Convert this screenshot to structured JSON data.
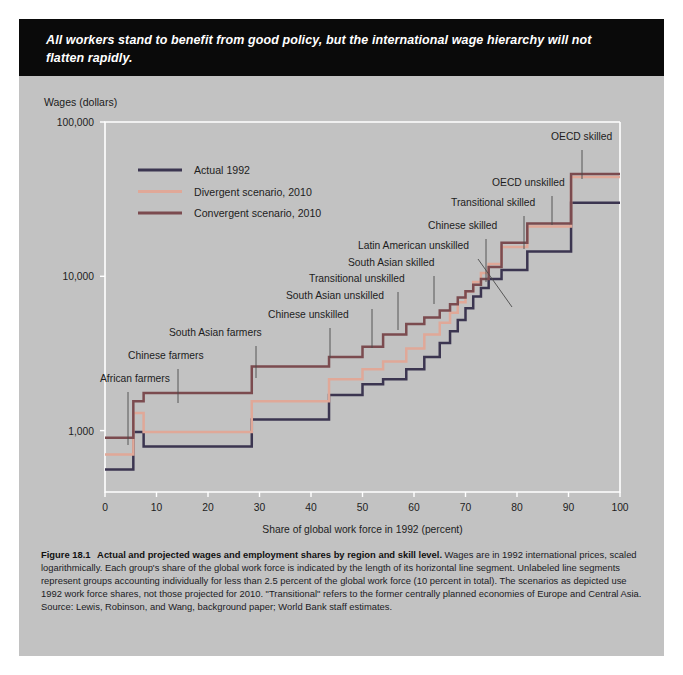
{
  "banner": {
    "text": "All workers stand to benefit from good policy, but the international wage hierarchy will not flatten rapidly."
  },
  "figure": {
    "number": "Figure 18.1",
    "title": "Actual and projected wages and employment shares by region and skill level.",
    "caption": " Wages are in 1992 international prices, scaled logarithmically.  Each group's share of the global work force is indicated by the length of its horizontal line segment. Unlabeled line segments represent groups accounting individually for less than 2.5 percent of the global work force (10 percent in total). The scenarios as depicted use 1992 work force shares, not those projected for 2010. \"Transitional\" refers to the former centrally planned economies of Europe and Central Asia. Source: Lewis, Robinson, and Wang, background paper; World Bank staff estimates."
  },
  "colors": {
    "page": "#c2c2c2",
    "banner": "#0a0a0a",
    "actual": "#3b3550",
    "divergent": "#e0a898",
    "convergent": "#7b4b4f",
    "axis": "#ffffff",
    "text": "#1d1d1d"
  },
  "chart_data": {
    "type": "line",
    "title": "Actual and projected wages and employment shares by region and skill level",
    "xlabel": "Share of global work force in 1992 (percent)",
    "ylabel": "Wages (dollars)",
    "xlim": [
      0,
      100
    ],
    "ylim": [
      400,
      100000
    ],
    "yscale": "log",
    "grid": false,
    "legend_position": "upper-left-inside",
    "xticks": [
      0,
      10,
      20,
      30,
      40,
      50,
      60,
      70,
      80,
      90,
      100
    ],
    "xticklabels": [
      "0",
      "10",
      "20",
      "30",
      "40",
      "50",
      "60",
      "70",
      "80",
      "90",
      "100"
    ],
    "yticks": [
      1000,
      10000,
      100000
    ],
    "yticklabels": [
      "1,000",
      "10,000",
      "100,000"
    ],
    "series": [
      {
        "name": "Actual 1992",
        "color": "#3b3550",
        "steps": [
          {
            "x0": 0,
            "x1": 5.5,
            "y": 560
          },
          {
            "x0": 5.5,
            "x1": 7.5,
            "y": 980
          },
          {
            "x0": 7.5,
            "x1": 28.5,
            "y": 790
          },
          {
            "x0": 28.5,
            "x1": 43.5,
            "y": 1180
          },
          {
            "x0": 43.5,
            "x1": 50.0,
            "y": 1700
          },
          {
            "x0": 50.0,
            "x1": 54.0,
            "y": 2000
          },
          {
            "x0": 54.0,
            "x1": 58.5,
            "y": 2150
          },
          {
            "x0": 58.5,
            "x1": 62.0,
            "y": 2500
          },
          {
            "x0": 62.0,
            "x1": 65.0,
            "y": 3000
          },
          {
            "x0": 65.0,
            "x1": 67.0,
            "y": 3700
          },
          {
            "x0": 67.0,
            "x1": 68.5,
            "y": 4400
          },
          {
            "x0": 68.5,
            "x1": 70.0,
            "y": 5200
          },
          {
            "x0": 70.0,
            "x1": 71.5,
            "y": 6200
          },
          {
            "x0": 71.5,
            "x1": 73.0,
            "y": 7400
          },
          {
            "x0": 73.0,
            "x1": 74.5,
            "y": 8400
          },
          {
            "x0": 74.5,
            "x1": 77.0,
            "y": 9600
          },
          {
            "x0": 77.0,
            "x1": 82.0,
            "y": 11000
          },
          {
            "x0": 82.0,
            "x1": 90.5,
            "y": 14500
          },
          {
            "x0": 90.5,
            "x1": 100,
            "y": 30000
          }
        ]
      },
      {
        "name": "Divergent scenario, 2010",
        "color": "#e0a898",
        "steps": [
          {
            "x0": 0,
            "x1": 5.5,
            "y": 700
          },
          {
            "x0": 5.5,
            "x1": 7.5,
            "y": 1300
          },
          {
            "x0": 7.5,
            "x1": 28.5,
            "y": 980
          },
          {
            "x0": 28.5,
            "x1": 43.5,
            "y": 1550
          },
          {
            "x0": 43.5,
            "x1": 50.0,
            "y": 2150
          },
          {
            "x0": 50.0,
            "x1": 54.0,
            "y": 2500
          },
          {
            "x0": 54.0,
            "x1": 58.5,
            "y": 2800
          },
          {
            "x0": 58.5,
            "x1": 62.0,
            "y": 3400
          },
          {
            "x0": 62.0,
            "x1": 65.0,
            "y": 4200
          },
          {
            "x0": 65.0,
            "x1": 67.0,
            "y": 5000
          },
          {
            "x0": 67.0,
            "x1": 68.5,
            "y": 5800
          },
          {
            "x0": 68.5,
            "x1": 70.0,
            "y": 6800
          },
          {
            "x0": 70.0,
            "x1": 71.5,
            "y": 8000
          },
          {
            "x0": 71.5,
            "x1": 73.0,
            "y": 9200
          },
          {
            "x0": 73.0,
            "x1": 74.5,
            "y": 10500
          },
          {
            "x0": 74.5,
            "x1": 77.0,
            "y": 12000
          },
          {
            "x0": 77.0,
            "x1": 82.0,
            "y": 15500
          },
          {
            "x0": 82.0,
            "x1": 90.5,
            "y": 21000
          },
          {
            "x0": 90.5,
            "x1": 100,
            "y": 44000
          }
        ]
      },
      {
        "name": "Convergent scenario, 2010",
        "color": "#7b4b4f",
        "steps": [
          {
            "x0": 0,
            "x1": 5.5,
            "y": 900
          },
          {
            "x0": 5.5,
            "x1": 7.5,
            "y": 1550
          },
          {
            "x0": 7.5,
            "x1": 28.5,
            "y": 1750
          },
          {
            "x0": 28.5,
            "x1": 43.5,
            "y": 2600
          },
          {
            "x0": 43.5,
            "x1": 50.0,
            "y": 3000
          },
          {
            "x0": 50.0,
            "x1": 54.0,
            "y": 3500
          },
          {
            "x0": 54.0,
            "x1": 58.5,
            "y": 4200
          },
          {
            "x0": 58.5,
            "x1": 62.0,
            "y": 4900
          },
          {
            "x0": 62.0,
            "x1": 65.0,
            "y": 5400
          },
          {
            "x0": 65.0,
            "x1": 67.0,
            "y": 6000
          },
          {
            "x0": 67.0,
            "x1": 68.5,
            "y": 6600
          },
          {
            "x0": 68.5,
            "x1": 70.0,
            "y": 7300
          },
          {
            "x0": 70.0,
            "x1": 71.5,
            "y": 8000
          },
          {
            "x0": 71.5,
            "x1": 73.0,
            "y": 8800
          },
          {
            "x0": 73.0,
            "x1": 74.5,
            "y": 9600
          },
          {
            "x0": 74.5,
            "x1": 77.0,
            "y": 11500
          },
          {
            "x0": 77.0,
            "x1": 82.0,
            "y": 16500
          },
          {
            "x0": 82.0,
            "x1": 90.5,
            "y": 22000
          },
          {
            "x0": 90.5,
            "x1": 100,
            "y": 46000
          }
        ]
      }
    ],
    "annotations": [
      {
        "text": "African farmers",
        "tx": 100,
        "ty": 382,
        "lx": 128,
        "ly": 392,
        "lx2": 128,
        "ly2": 445,
        "anchor": "start"
      },
      {
        "text": "Chinese farmers",
        "tx": 128,
        "ty": 359,
        "lx": 178,
        "ly": 369,
        "lx2": 178,
        "ly2": 403,
        "anchor": "start"
      },
      {
        "text": "South Asian farmers",
        "tx": 169,
        "ty": 336,
        "lx": 256,
        "ly": 346,
        "lx2": 256,
        "ly2": 378,
        "anchor": "start"
      },
      {
        "text": "Chinese unskilled",
        "tx": 268,
        "ty": 318,
        "lx": 330,
        "ly": 328,
        "lx2": 330,
        "ly2": 358,
        "anchor": "start"
      },
      {
        "text": "South Asian unskilled",
        "tx": 286,
        "ty": 299,
        "lx": 372,
        "ly": 309,
        "lx2": 372,
        "ly2": 348,
        "anchor": "start"
      },
      {
        "text": "Transitional unskilled",
        "tx": 309,
        "ty": 282,
        "lx": 398,
        "ly": 292,
        "lx2": 398,
        "ly2": 330,
        "anchor": "start"
      },
      {
        "text": "South Asian skilled",
        "tx": 348,
        "ty": 266,
        "lx": 434,
        "ly": 276,
        "lx2": 434,
        "ly2": 304,
        "anchor": "start"
      },
      {
        "text": "Latin American unskilled",
        "tx": 358,
        "ty": 249,
        "lx": 478,
        "ly": 259,
        "lx2": 512,
        "ly2": 307,
        "anchor": "start"
      },
      {
        "text": "Chinese skilled",
        "tx": 428,
        "ty": 229,
        "lx": 486,
        "ly": 239,
        "lx2": 486,
        "ly2": 282,
        "anchor": "start"
      },
      {
        "text": "Transitional skilled",
        "tx": 451,
        "ty": 206,
        "lx": 524,
        "ly": 216,
        "lx2": 524,
        "ly2": 249,
        "anchor": "start"
      },
      {
        "text": "OECD unskilled",
        "tx": 492,
        "ty": 186,
        "lx": 552,
        "ly": 196,
        "lx2": 552,
        "ly2": 225,
        "anchor": "start"
      },
      {
        "text": "OECD skilled",
        "tx": 551,
        "ty": 140,
        "lx": 582,
        "ly": 150,
        "lx2": 582,
        "ly2": 179,
        "anchor": "start"
      }
    ],
    "legend": [
      {
        "label": "Actual 1992",
        "color": "#3b3550"
      },
      {
        "label": "Divergent scenario, 2010",
        "color": "#e0a898"
      },
      {
        "label": "Convergent scenario, 2010",
        "color": "#7b4b4f"
      }
    ]
  }
}
